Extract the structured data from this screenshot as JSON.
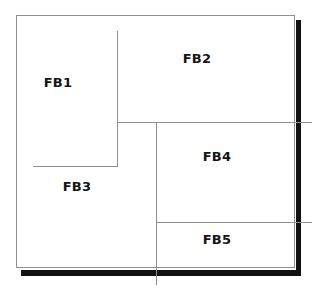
{
  "diagram": {
    "background_color": "#ffffff",
    "line_color": "#8f8f8f",
    "shadow_color": "#111111",
    "label_color": "#141414",
    "regions": [
      {
        "id": "fb1",
        "label": "FB1",
        "center_x": 58,
        "center_y": 82
      },
      {
        "id": "fb2",
        "label": "FB2",
        "center_x": 197,
        "center_y": 58
      },
      {
        "id": "fb3",
        "label": "FB3",
        "center_x": 77,
        "center_y": 186
      },
      {
        "id": "fb4",
        "label": "FB4",
        "center_x": 217,
        "center_y": 156
      },
      {
        "id": "fb5",
        "label": "FB5",
        "center_x": 217,
        "center_y": 239
      }
    ]
  }
}
